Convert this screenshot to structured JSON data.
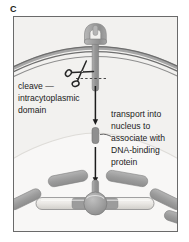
{
  "panel": {
    "label": "C"
  },
  "figure": {
    "background_color": "#f2f1ef",
    "border_color": "#6a6a6a"
  },
  "annotations": {
    "cleave": {
      "lines": [
        "cleave  —",
        "intracytoplasmic",
        "domain"
      ],
      "line1": "cleave  —",
      "line2": "intracytoplasmic",
      "line3": "domain"
    },
    "transport": {
      "lines": [
        "transport into",
        "nucleus to",
        "associate with",
        "DNA-binding",
        "protein"
      ],
      "line1": "transport into",
      "line2": "nucleus to",
      "line3": "associate with",
      "line4": "DNA-binding",
      "line5": "protein"
    }
  },
  "elements": {
    "plasma_membrane": {
      "name": "plasma-membrane",
      "color": "#8d8d8d"
    },
    "receptor": {
      "name": "membrane-receptor",
      "color": "#9a9a9a"
    },
    "scissors": {
      "name": "scissors-icon",
      "color": "#2a2a2a"
    },
    "cleavage_site": {
      "name": "dashed-cleavage-line",
      "color": "#4a4a4a"
    },
    "fragment": {
      "name": "cleaved-intracytoplasmic-domain",
      "color": "#8a8a8a"
    },
    "arrow_upper": {
      "name": "transport-arrow-upper",
      "color": "#1c1c1c"
    },
    "arrow_lower": {
      "name": "transport-arrow-lower",
      "color": "#1c1c1c"
    },
    "chromatin": {
      "name": "chromatin-segment",
      "color": "#a0a0a0",
      "count": 5
    },
    "dna_strand": {
      "name": "dna-strand",
      "color": "#e8e7e4"
    },
    "dna_binding_protein": {
      "name": "dna-binding-protein",
      "color": "#9c9c9c"
    },
    "nucleus": {
      "name": "nucleus-region",
      "color": "#f7f6f4"
    }
  },
  "colors": {
    "ink": "#1c1c1c",
    "mid_gray": "#9a9a9a",
    "dark_gray": "#6f6f6f",
    "light_gray": "#cfcecb",
    "panel_bg": "#f2f1ef"
  }
}
